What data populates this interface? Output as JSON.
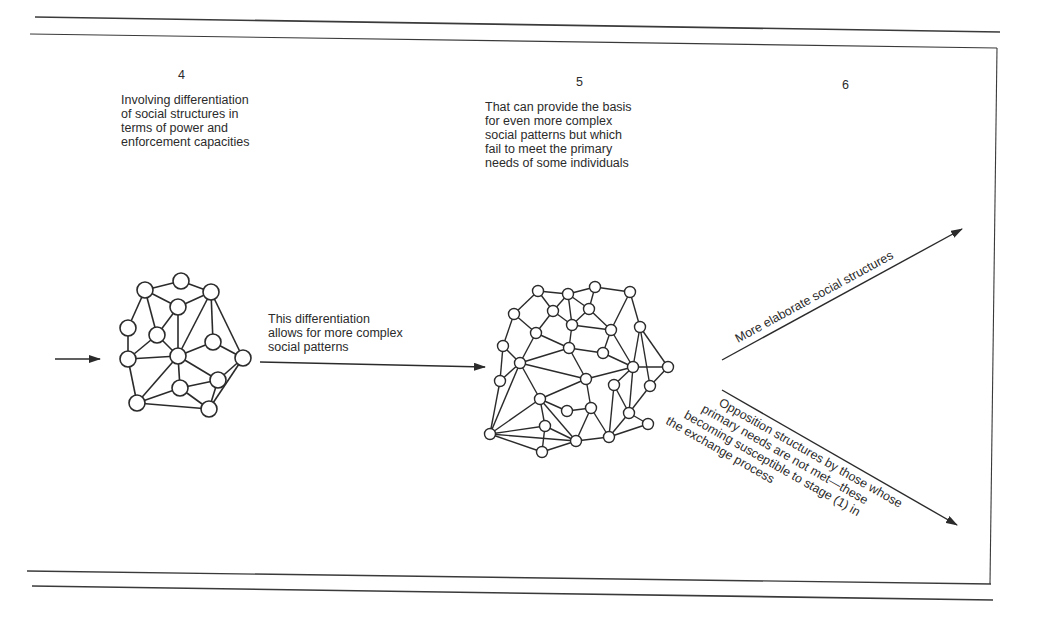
{
  "figure": {
    "stages": [
      {
        "number": "4",
        "caption": "Involving differentiation\nof social structures in\nterms of power and\nenforcement capacities"
      },
      {
        "number": "5",
        "caption": "That can provide the basis\nfor even more complex\nsocial patterns  but which\nfail to meet the primary\nneeds of some individuals"
      },
      {
        "number": "6",
        "caption": ""
      }
    ],
    "arrow_labels": {
      "middle": "This differentiation\nallows for more complex\nsocial patterns",
      "upper_branch": "More elaborate social structures",
      "lower_branch": [
        "Opposition structures by those whose",
        "primary needs are not met—these",
        "becoming susceptible to stage (1) in",
        "the exchange process"
      ]
    },
    "colors": {
      "ink": "#2b2b2b",
      "paper": "#ffffff"
    }
  }
}
